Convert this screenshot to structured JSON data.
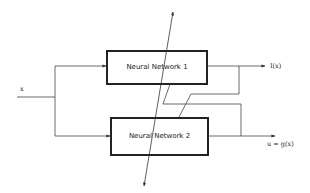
{
  "diagram": {
    "input_label": "x",
    "blocks": [
      {
        "id": "nn1",
        "label": "Neural Network 1"
      },
      {
        "id": "nn2",
        "label": "Neural Network 2"
      }
    ],
    "outputs": [
      {
        "id": "out1",
        "label": "I(x)"
      },
      {
        "id": "out2",
        "label": "u = g(x)"
      }
    ],
    "colors": {
      "line": "#333333",
      "box_border": "#222222",
      "background": "#ffffff"
    }
  }
}
